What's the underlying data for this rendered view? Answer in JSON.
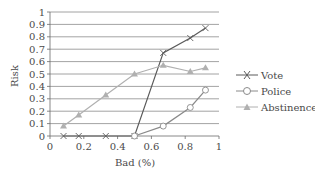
{
  "chart_data": {
    "type": "line",
    "title": "",
    "xlabel": "Bad (%)",
    "ylabel": "Risk",
    "xlim": [
      0,
      1
    ],
    "ylim": [
      0,
      1
    ],
    "x_ticks": [
      "0",
      "0.2",
      "0.4",
      "0.6",
      "0.8",
      "1"
    ],
    "y_ticks": [
      "0",
      "0.1",
      "0.2",
      "0.3",
      "0.4",
      "0.5",
      "0.6",
      "0.7",
      "0.8",
      "0.9",
      "1"
    ],
    "grid": "horizontal",
    "legend_position": "right",
    "series": [
      {
        "name": "Vote",
        "marker": "x",
        "color": "#5a5a5a",
        "x": [
          0.08,
          0.17,
          0.33,
          0.5,
          0.67,
          0.83,
          0.92
        ],
        "y": [
          0,
          0,
          0,
          0,
          0.67,
          0.79,
          0.87
        ]
      },
      {
        "name": "Police",
        "marker": "circle",
        "color": "#8a8a8a",
        "x": [
          0.5,
          0.67,
          0.83,
          0.92
        ],
        "y": [
          0,
          0.08,
          0.23,
          0.37
        ]
      },
      {
        "name": "Abstinence",
        "marker": "triangle",
        "color": "#b0b0b0",
        "x": [
          0.08,
          0.17,
          0.33,
          0.5,
          0.67,
          0.83,
          0.92
        ],
        "y": [
          0.08,
          0.17,
          0.33,
          0.5,
          0.57,
          0.52,
          0.55
        ]
      }
    ]
  },
  "legend": {
    "items": [
      {
        "label": "Vote"
      },
      {
        "label": "Police"
      },
      {
        "label": "Abstinence"
      }
    ]
  }
}
